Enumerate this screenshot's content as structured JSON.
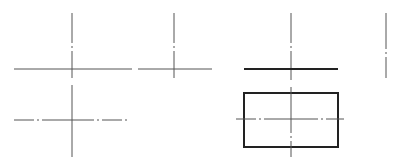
{
  "diagram": {
    "title": "",
    "colors": {
      "background": "#ffffff",
      "thin_line": "#555555",
      "thick_line": "#222222"
    },
    "figures": [
      {
        "id": "cross-1",
        "vertical": {
          "x": 72,
          "y1": 13,
          "y2": 78,
          "style": "dash-dot"
        },
        "horizontal": {
          "y": 69,
          "x1": 14,
          "x2": 132,
          "style": "solid-thin"
        }
      },
      {
        "id": "cross-2",
        "vertical": {
          "x": 174,
          "y1": 13,
          "y2": 78,
          "style": "dash-dot"
        },
        "horizontal": {
          "y": 69,
          "x1": 138,
          "x2": 212,
          "style": "solid-thin"
        }
      },
      {
        "id": "cross-3",
        "vertical": {
          "x": 291,
          "y1": 13,
          "y2": 80,
          "style": "dash-dot"
        },
        "horizontal": {
          "y": 69,
          "x1": 244,
          "x2": 338,
          "style": "solid-thick"
        }
      },
      {
        "id": "standalone-vertical",
        "vertical": {
          "x": 386,
          "y1": 13,
          "y2": 78,
          "style": "dash-dot"
        }
      },
      {
        "id": "cross-4",
        "vertical": {
          "x": 72,
          "y1": 85,
          "y2": 157,
          "style": "solid-thin"
        },
        "horizontal": {
          "y": 120,
          "x1": 14,
          "x2": 128,
          "style": "dash-dot"
        }
      },
      {
        "id": "rectangle-with-centerlines",
        "rect": {
          "x": 244,
          "y": 93,
          "width": 94,
          "height": 54,
          "style": "solid-thick"
        },
        "vertical": {
          "x": 291,
          "y1": 87,
          "y2": 157,
          "style": "dash-dot-short"
        },
        "horizontal": {
          "y": 119,
          "x1": 236,
          "x2": 344,
          "style": "dash-dot"
        }
      }
    ]
  }
}
